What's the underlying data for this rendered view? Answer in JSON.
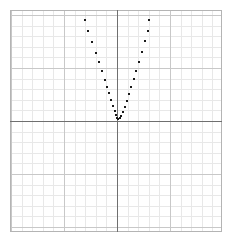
{
  "chart_data": {
    "type": "scatter",
    "title": "",
    "subtitle": "",
    "xlabel": "",
    "ylabel": "",
    "grid": true,
    "legend": null,
    "legend_position": "none",
    "axes_visible": true,
    "tick_labels_x": [],
    "tick_labels_y": [],
    "xlim": [
      -10,
      10
    ],
    "ylim": [
      -11,
      9
    ],
    "origin_px": {
      "x": 117,
      "y": 121
    },
    "cell_px": 10.6,
    "marker": {
      "shape": "square",
      "size_px": 2.6,
      "color": "#1a1a1a"
    },
    "series": [
      {
        "name": "parabola",
        "points_px": [
          [
            85,
            20
          ],
          [
            88,
            31
          ],
          [
            92,
            42
          ],
          [
            96,
            53
          ],
          [
            99,
            62
          ],
          [
            102,
            71
          ],
          [
            105,
            80
          ],
          [
            107,
            87
          ],
          [
            109,
            93
          ],
          [
            111,
            100
          ],
          [
            113,
            106
          ],
          [
            115,
            111
          ],
          [
            116,
            115
          ],
          [
            117,
            118
          ],
          [
            118,
            119
          ],
          [
            120,
            118
          ],
          [
            121,
            116
          ],
          [
            123,
            112
          ],
          [
            125,
            107
          ],
          [
            127,
            101
          ],
          [
            129,
            94
          ],
          [
            131,
            87
          ],
          [
            134,
            79
          ],
          [
            136,
            71
          ],
          [
            139,
            62
          ],
          [
            142,
            52
          ],
          [
            145,
            41
          ],
          [
            148,
            31
          ],
          [
            149,
            20
          ]
        ]
      }
    ]
  },
  "plot": {
    "area_px": {
      "x": 10,
      "y": 10,
      "width": 212,
      "height": 222
    },
    "colors": {
      "background": "#ffffff",
      "minor_grid": "#e8e8e8",
      "major_grid": "#c8c8c8",
      "border": "#b4b4b4",
      "axis": "#6f6f6f",
      "marker": "#1a1a1a"
    },
    "grid_cols": 20,
    "grid_rows": 21
  }
}
